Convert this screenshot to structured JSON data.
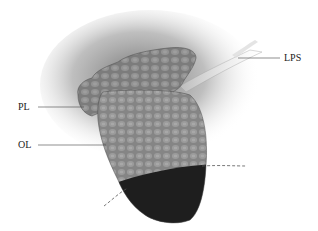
{
  "figure": {
    "labels": [
      {
        "id": "lps",
        "text": "LPS",
        "x": 284,
        "y": 53
      },
      {
        "id": "pl",
        "text": "PL",
        "x": 18,
        "y": 103
      },
      {
        "id": "ol",
        "text": "OL",
        "x": 18,
        "y": 140
      }
    ],
    "colors": {
      "background": "#ffffff",
      "shadow": "#6f6f6f",
      "palpebral_lobe": "#7a7a7a",
      "orbital_lobe": "#858585",
      "dark_region": "#1e1e1e",
      "tendon": "#e2e2e2",
      "leader_line": "#444444",
      "dashed_line": "#555555"
    }
  }
}
